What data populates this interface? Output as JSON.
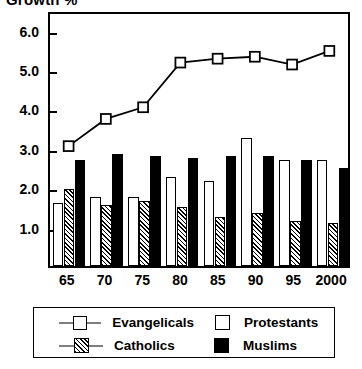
{
  "chart_data": {
    "type": "bar",
    "title": "Growth %",
    "xlabel": "",
    "ylabel": "",
    "categories": [
      "65",
      "70",
      "75",
      "80",
      "85",
      "90",
      "95",
      "2000"
    ],
    "ylim": [
      0,
      6.5
    ],
    "yticks": [
      1.0,
      2.0,
      3.0,
      4.0,
      5.0,
      6.0
    ],
    "ytick_labels": [
      "1.0",
      "2.0",
      "3.0",
      "4.0",
      "5.0",
      "6.0"
    ],
    "grid": false,
    "legend_position": "below",
    "series": [
      {
        "name": "Evangelicals",
        "kind": "line",
        "marker": "open-square",
        "values": [
          3.1,
          3.8,
          4.1,
          5.25,
          5.35,
          5.4,
          5.2,
          5.55
        ]
      },
      {
        "name": "Protestants",
        "kind": "bar",
        "fill": "open",
        "values": [
          1.6,
          1.75,
          1.75,
          2.25,
          2.15,
          3.25,
          2.7,
          2.7
        ]
      },
      {
        "name": "Catholics",
        "kind": "bar",
        "fill": "hatched",
        "values": [
          1.95,
          1.55,
          1.65,
          1.5,
          1.25,
          1.35,
          1.15,
          1.1
        ]
      },
      {
        "name": "Muslims",
        "kind": "bar",
        "fill": "solid",
        "values": [
          2.7,
          2.85,
          2.8,
          2.75,
          2.8,
          2.8,
          2.7,
          2.5
        ]
      }
    ]
  },
  "legend": {
    "entries": [
      {
        "label": "Evangelicals",
        "swatch": "line-open-square-marker"
      },
      {
        "label": "Protestants",
        "swatch": "open-square"
      },
      {
        "label": "Catholics",
        "swatch": "hatched-square"
      },
      {
        "label": "Muslims",
        "swatch": "solid-black-square"
      }
    ]
  }
}
